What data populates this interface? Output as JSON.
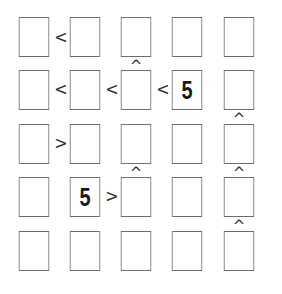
{
  "puzzle": {
    "type": "futoshiki",
    "size": 5,
    "grid": [
      [
        "",
        "",
        "",
        "",
        ""
      ],
      [
        "",
        "",
        "",
        "5",
        ""
      ],
      [
        "",
        "",
        "",
        "",
        ""
      ],
      [
        "",
        "5",
        "",
        "",
        ""
      ],
      [
        "",
        "",
        "",
        "",
        ""
      ]
    ],
    "horizontal_constraints": [
      {
        "row": 0,
        "col": 0,
        "symbol": "<"
      },
      {
        "row": 1,
        "col": 0,
        "symbol": "<"
      },
      {
        "row": 1,
        "col": 1,
        "symbol": "<"
      },
      {
        "row": 1,
        "col": 2,
        "symbol": "<"
      },
      {
        "row": 2,
        "col": 0,
        "symbol": ">"
      },
      {
        "row": 3,
        "col": 1,
        "symbol": ">"
      }
    ],
    "vertical_constraints": [
      {
        "row": 0,
        "col": 2,
        "symbol": "^"
      },
      {
        "row": 1,
        "col": 4,
        "symbol": "^"
      },
      {
        "row": 2,
        "col": 2,
        "symbol": "^"
      },
      {
        "row": 2,
        "col": 4,
        "symbol": "^"
      },
      {
        "row": 3,
        "col": 4,
        "symbol": "^"
      }
    ]
  },
  "layout": {
    "col_x": [
      15,
      66,
      117,
      168,
      220
    ],
    "row_y": [
      17,
      70,
      124,
      177,
      231
    ],
    "colors": {
      "border": "#6e6e6e",
      "text": "#1a1a1a",
      "symbol": "#333333",
      "background": "#ffffff"
    }
  }
}
